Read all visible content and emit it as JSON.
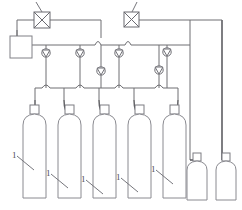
{
  "diagram": {
    "type": "process-flow-schematic",
    "background_color": "#ffffff",
    "line_color": "#6e6e72",
    "labels": [
      {
        "id": "lbl-1",
        "text": "1",
        "x": 12,
        "y": 158
      },
      {
        "id": "lbl-2",
        "text": "1",
        "x": 46,
        "y": 176
      },
      {
        "id": "lbl-3",
        "text": "1",
        "x": 81,
        "y": 182
      },
      {
        "id": "lbl-4",
        "text": "1",
        "x": 116,
        "y": 180
      },
      {
        "id": "lbl-5",
        "text": "1",
        "x": 151,
        "y": 172
      },
      {
        "id": "lbl-valve-left",
        "text": "2",
        "x": 29,
        "y": 6
      },
      {
        "id": "lbl-valve-right",
        "text": "2",
        "x": 131,
        "y": 6
      }
    ],
    "components": {
      "shutoff_valves": [
        {
          "name": "shutoff-valve-left",
          "x": 34,
          "y": 12,
          "size": 16
        },
        {
          "name": "shutoff-valve-right",
          "x": 124,
          "y": 12,
          "size": 15
        }
      ],
      "check_valves": [
        {
          "name": "check-valve-1",
          "cx": 46,
          "cy": 53
        },
        {
          "name": "check-valve-2",
          "cx": 80,
          "cy": 53
        },
        {
          "name": "check-valve-3",
          "cx": 119,
          "cy": 53
        },
        {
          "name": "check-valve-4",
          "cx": 167,
          "cy": 52
        },
        {
          "name": "check-valve-5",
          "cx": 100,
          "cy": 71
        },
        {
          "name": "check-valve-6",
          "cx": 159,
          "cy": 70
        }
      ],
      "receiver_tank": {
        "name": "receiver-tank",
        "x": 10,
        "y": 36,
        "w": 22,
        "h": 22
      },
      "tall_cylinders": [
        {
          "name": "gas-cylinder-1",
          "x": 22,
          "y": 113,
          "w": 23,
          "h": 85
        },
        {
          "name": "gas-cylinder-2",
          "x": 57,
          "y": 113,
          "w": 23,
          "h": 85
        },
        {
          "name": "gas-cylinder-3",
          "x": 92,
          "y": 113,
          "w": 23,
          "h": 85
        },
        {
          "name": "gas-cylinder-4",
          "x": 127,
          "y": 113,
          "w": 23,
          "h": 85
        },
        {
          "name": "gas-cylinder-5",
          "x": 162,
          "y": 113,
          "w": 23,
          "h": 85
        }
      ],
      "short_cylinders": [
        {
          "name": "gas-cylinder-6",
          "x": 186,
          "y": 160,
          "w": 22,
          "h": 40
        },
        {
          "name": "gas-cylinder-7",
          "x": 215,
          "y": 160,
          "w": 22,
          "h": 40
        }
      ]
    },
    "counts": {
      "tall_cylinders": 5,
      "short_cylinders": 2,
      "shutoff_valves": 2,
      "check_valves": 6
    }
  }
}
